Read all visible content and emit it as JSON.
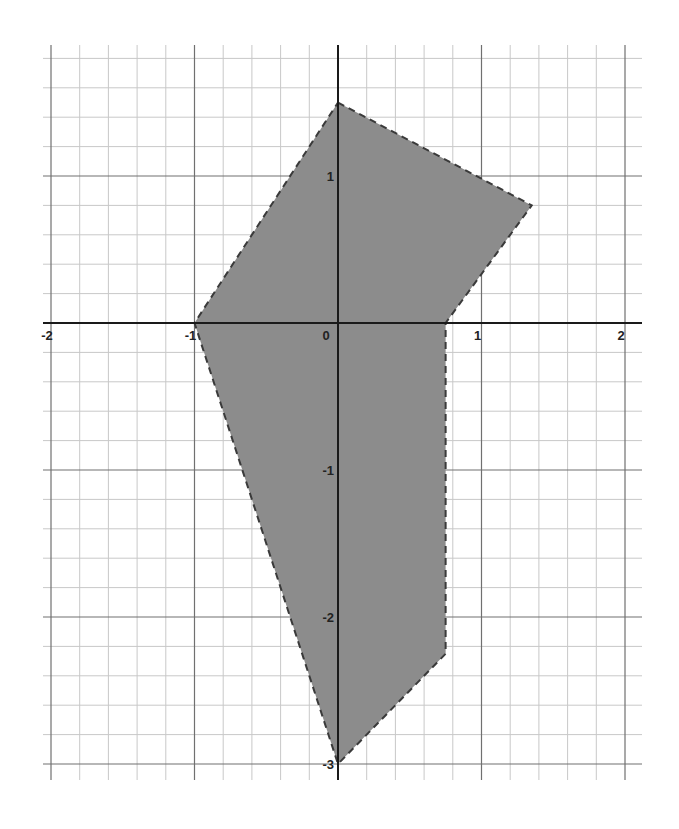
{
  "chart_data": {
    "type": "area",
    "title": "",
    "xlabel": "",
    "ylabel": "",
    "xlim": [
      -2,
      2
    ],
    "ylim": [
      -3,
      1.8
    ],
    "grid": true,
    "grid_minor_step": 0.2,
    "grid_major_step": 1,
    "x_ticks": [
      {
        "value": -2,
        "label": "-2"
      },
      {
        "value": -1,
        "label": "-1"
      },
      {
        "value": 0,
        "label": "0"
      },
      {
        "value": 1,
        "label": "1"
      },
      {
        "value": 2,
        "label": "2"
      }
    ],
    "y_ticks": [
      {
        "value": 1,
        "label": "1"
      },
      {
        "value": -1,
        "label": "-1"
      },
      {
        "value": -2,
        "label": "-2"
      },
      {
        "value": -3,
        "label": "-3"
      }
    ],
    "series": [
      {
        "name": "shaded-region",
        "kind": "polygon",
        "border": "dashed",
        "fill_color": "#8c8c8c",
        "border_color": "#3a3a3a",
        "vertices": [
          {
            "x": 0,
            "y": 1.5
          },
          {
            "x": 1.35,
            "y": 0.8
          },
          {
            "x": 0.75,
            "y": 0
          },
          {
            "x": 0.75,
            "y": -2.25
          },
          {
            "x": 0,
            "y": -3
          },
          {
            "x": -1,
            "y": 0
          }
        ]
      }
    ]
  },
  "layout": {
    "origin_px": {
      "x": 338,
      "y": 323
    },
    "px_per_unit_x": 143.5,
    "px_per_unit_y": 147,
    "grid_px": {
      "left": 43,
      "right": 642,
      "top": 45,
      "bottom": 780
    }
  }
}
